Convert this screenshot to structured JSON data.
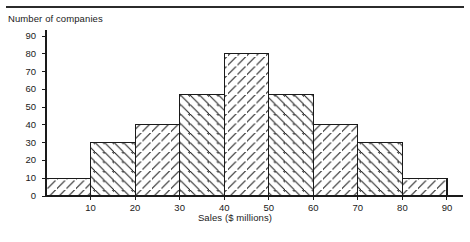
{
  "chart_data": {
    "type": "bar",
    "title": "",
    "subtitle": "",
    "xlabel": "Sales ($ millions)",
    "ylabel": "Number of companies",
    "categories": [
      "0-10",
      "10-20",
      "20-30",
      "30-40",
      "40-50",
      "50-60",
      "60-70",
      "70-80",
      "80-90"
    ],
    "bin_edges": [
      0,
      10,
      20,
      30,
      40,
      50,
      60,
      70,
      80,
      90
    ],
    "values": [
      10,
      30,
      40,
      57,
      80,
      57,
      40,
      30,
      10
    ],
    "xlim": [
      0,
      90
    ],
    "ylim": [
      0,
      90
    ],
    "xticks": [
      10,
      20,
      30,
      40,
      50,
      60,
      70,
      80,
      90
    ],
    "yticks": [
      0,
      10,
      20,
      30,
      40,
      50,
      60,
      70,
      80,
      90
    ],
    "xtick_labels": [
      "10",
      "20",
      "30",
      "40",
      "50",
      "60",
      "70",
      "80",
      "90"
    ],
    "ytick_labels": [
      "0",
      "10",
      "20",
      "30",
      "40",
      "50",
      "60",
      "70",
      "80",
      "90"
    ],
    "grid": false,
    "legend": null,
    "bar_fill": "#ffffff",
    "bar_stroke": "#1a1a1a",
    "hatch": "diagonal-lines",
    "hatch_directions": [
      "forward",
      "backward",
      "forward",
      "backward",
      "forward",
      "backward",
      "forward",
      "backward",
      "forward"
    ],
    "annotations": []
  },
  "axes": {
    "y_title": "Number of companies",
    "x_title": "Sales ($ millions)"
  },
  "colors": {
    "ink": "#1a1a1a",
    "rule": "#2b2b2b",
    "background": "#ffffff"
  }
}
